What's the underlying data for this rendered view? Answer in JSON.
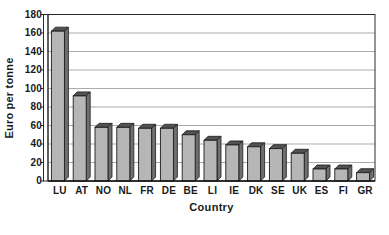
{
  "chart_data": {
    "type": "bar",
    "title": "",
    "xlabel": "Country",
    "ylabel": "Euro per tonne",
    "categories": [
      "LU",
      "AT",
      "NO",
      "NL",
      "FR",
      "DE",
      "BE",
      "LI",
      "IE",
      "DK",
      "SE",
      "UK",
      "ES",
      "FI",
      "GR"
    ],
    "values": [
      162,
      92,
      58,
      58,
      57,
      57,
      50,
      44,
      39,
      37,
      35,
      30,
      13,
      13,
      9
    ],
    "ylim": [
      0,
      180
    ],
    "yticks": [
      0,
      20,
      40,
      60,
      80,
      100,
      120,
      140,
      160,
      180
    ],
    "grid": true,
    "legend": null,
    "style": {
      "bar_front_color": "#b6b6b6",
      "bar_side_color": "#6f6f6f",
      "bar_top_color": "#525252",
      "bar_outline_color": "#1c1c1c",
      "gridline_color": "#a2a2a2",
      "axis_color": "#2a2a2a",
      "plot_background": "#ffffff",
      "figure_background": "#ffffff",
      "text_color": "#1a1a1a"
    }
  }
}
